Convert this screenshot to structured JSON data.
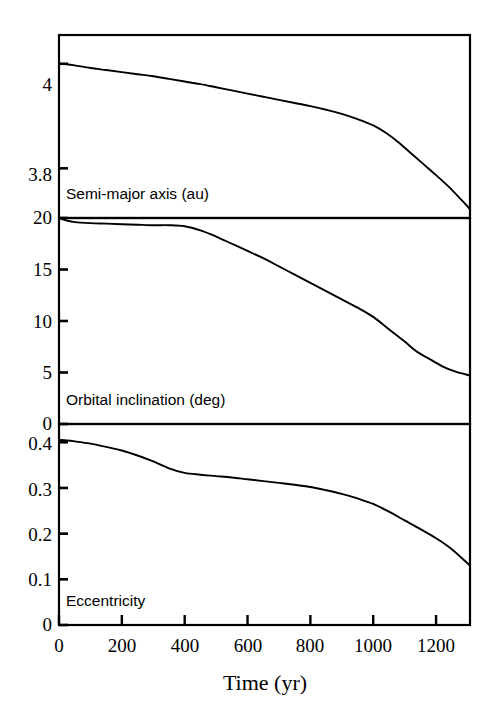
{
  "figure": {
    "background_color": "#ffffff",
    "line_color": "#000000",
    "axis_color": "#000000"
  },
  "axis": {
    "xlabel": "Time (yr)",
    "x_ticks": [
      0,
      200,
      400,
      600,
      800,
      1000,
      1200
    ],
    "x_tick_labels": [
      "0",
      "200",
      "400",
      "600",
      "800",
      "1000",
      "1200"
    ],
    "xlim": [
      0,
      1308
    ]
  },
  "panels": [
    {
      "id": "semi-major-axis",
      "label": "Semi-major axis (au)",
      "y_ticks": [
        4,
        3.8
      ],
      "y_tick_labels": [
        "4",
        "3.8"
      ],
      "ylim": [
        3.705,
        4.055
      ]
    },
    {
      "id": "orbital-inclination",
      "label": "Orbital inclination (deg)",
      "y_ticks": [
        20,
        15,
        10,
        5,
        0
      ],
      "y_tick_labels": [
        "20",
        "15",
        "10",
        "5",
        "0"
      ],
      "ylim": [
        0,
        20
      ]
    },
    {
      "id": "eccentricity",
      "label": "Eccentricity",
      "y_ticks": [
        0.4,
        0.3,
        0.2,
        0.1,
        0
      ],
      "y_tick_labels": [
        "0.4",
        "0.3",
        "0.2",
        "0.1",
        "0"
      ],
      "ylim": [
        0,
        0.44
      ]
    }
  ],
  "chart_data": [
    {
      "type": "line",
      "title": "Semi-major axis (au)",
      "xlabel": "Time (yr)",
      "ylabel": "Semi-major axis (au)",
      "xlim": [
        0,
        1308
      ],
      "ylim": [
        3.705,
        4.055
      ],
      "grid": false,
      "legend": "none",
      "x": [
        0,
        25,
        50,
        100,
        150,
        200,
        250,
        300,
        350,
        400,
        450,
        500,
        550,
        600,
        650,
        700,
        750,
        800,
        850,
        900,
        950,
        1000,
        1040,
        1080,
        1120,
        1160,
        1200,
        1240,
        1280,
        1308
      ],
      "y": [
        4.0,
        3.999,
        3.997,
        3.992,
        3.988,
        3.984,
        3.98,
        3.976,
        3.971,
        3.966,
        3.961,
        3.955,
        3.949,
        3.943,
        3.937,
        3.931,
        3.925,
        3.919,
        3.912,
        3.904,
        3.894,
        3.882,
        3.868,
        3.85,
        3.829,
        3.808,
        3.787,
        3.765,
        3.74,
        3.722
      ]
    },
    {
      "type": "line",
      "title": "Orbital inclination (deg)",
      "xlabel": "Time (yr)",
      "ylabel": "Orbital inclination (deg)",
      "xlim": [
        0,
        1308
      ],
      "ylim": [
        0,
        20
      ],
      "grid": false,
      "legend": "none",
      "x": [
        0,
        25,
        50,
        100,
        150,
        200,
        250,
        300,
        350,
        400,
        450,
        500,
        550,
        600,
        650,
        700,
        750,
        800,
        850,
        900,
        950,
        1000,
        1050,
        1100,
        1140,
        1180,
        1220,
        1260,
        1308
      ],
      "y": [
        20.0,
        19.75,
        19.6,
        19.5,
        19.45,
        19.4,
        19.35,
        19.3,
        19.3,
        19.2,
        18.8,
        18.2,
        17.5,
        16.8,
        16.1,
        15.3,
        14.5,
        13.7,
        12.9,
        12.1,
        11.3,
        10.4,
        9.2,
        8.0,
        7.0,
        6.3,
        5.6,
        5.1,
        4.7
      ]
    },
    {
      "type": "line",
      "title": "Eccentricity",
      "xlabel": "Time (yr)",
      "ylabel": "Eccentricity",
      "xlim": [
        0,
        1308
      ],
      "ylim": [
        0,
        0.44
      ],
      "grid": false,
      "legend": "none",
      "x": [
        0,
        25,
        50,
        100,
        150,
        200,
        250,
        300,
        350,
        400,
        450,
        500,
        550,
        600,
        650,
        700,
        750,
        800,
        850,
        900,
        950,
        1000,
        1050,
        1100,
        1150,
        1200,
        1250,
        1308
      ],
      "y": [
        0.405,
        0.404,
        0.402,
        0.397,
        0.39,
        0.382,
        0.371,
        0.358,
        0.343,
        0.333,
        0.329,
        0.326,
        0.323,
        0.319,
        0.315,
        0.311,
        0.307,
        0.302,
        0.295,
        0.287,
        0.277,
        0.265,
        0.248,
        0.229,
        0.21,
        0.19,
        0.166,
        0.13
      ]
    }
  ]
}
